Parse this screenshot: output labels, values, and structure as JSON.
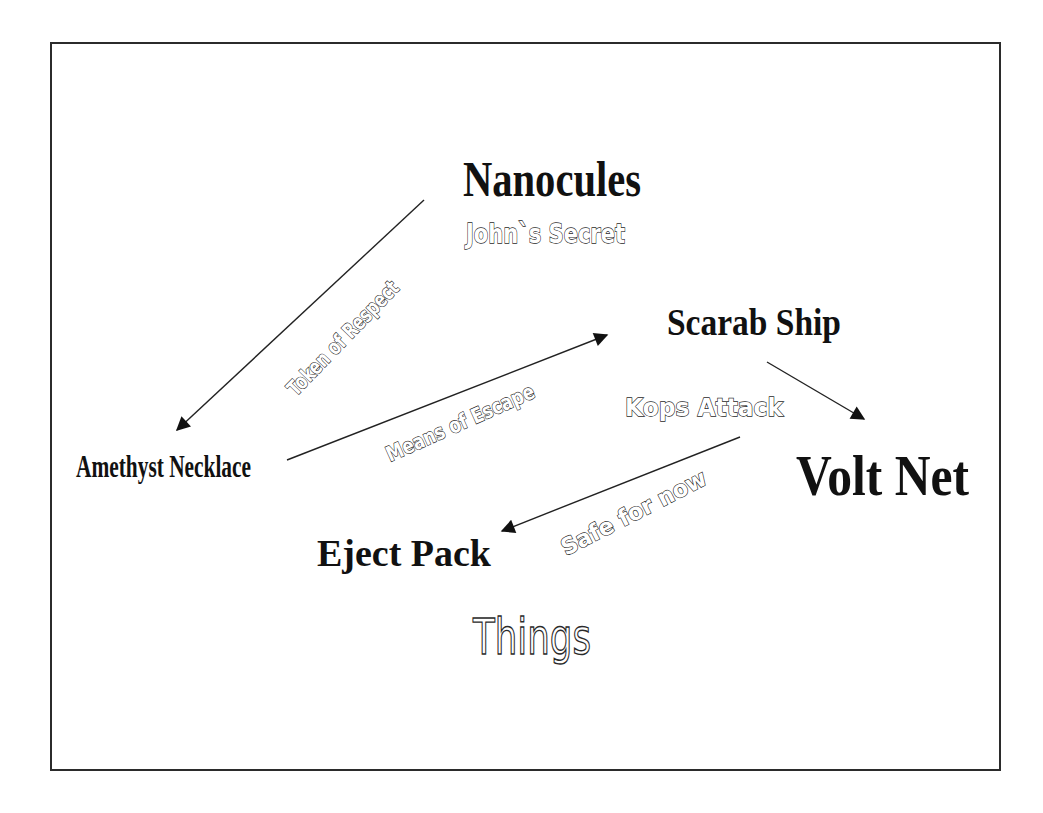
{
  "diagram": {
    "title": "Things",
    "frame": {
      "x": 51,
      "y": 43,
      "width": 949,
      "height": 727,
      "border_color": "#2b2b2b"
    },
    "nodes": [
      {
        "id": "nanocules",
        "label": "Nanocules",
        "subtitle": "John`s Secret"
      },
      {
        "id": "amethyst-necklace",
        "label": "Amethyst Necklace"
      },
      {
        "id": "scarab-ship",
        "label": "Scarab Ship"
      },
      {
        "id": "volt-net",
        "label": "Volt Net"
      },
      {
        "id": "eject-pack",
        "label": "Eject Pack"
      }
    ],
    "edges": [
      {
        "from": "nanocules",
        "to": "amethyst-necklace",
        "label": "Token of Respect"
      },
      {
        "from": "amethyst-necklace",
        "to": "scarab-ship",
        "label": "Means of Escape"
      },
      {
        "from": "scarab-ship",
        "to": "volt-net",
        "label": "Kops Attack"
      },
      {
        "from": "kops-attack",
        "to": "eject-pack",
        "label": "Safe for now"
      }
    ],
    "colors": {
      "text": "#111111",
      "line": "#222222",
      "outline_fill": "#ffffff",
      "outline_stroke": "#2a2a2a",
      "background": "#ffffff"
    }
  }
}
